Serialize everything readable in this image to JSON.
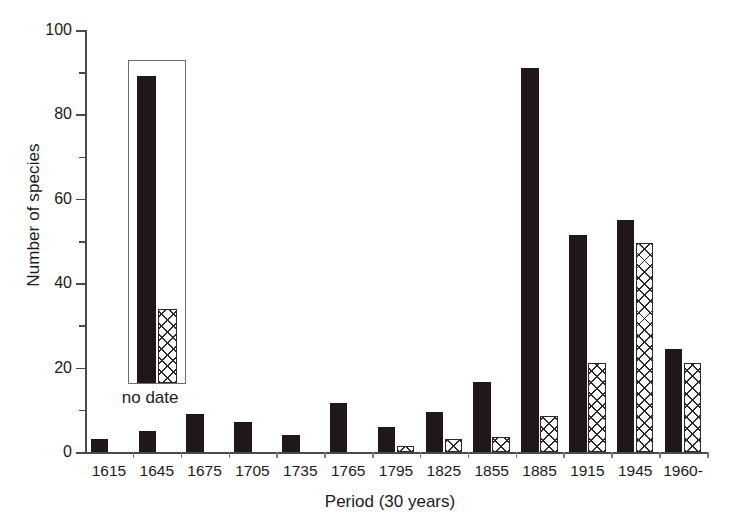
{
  "chart_data": {
    "type": "bar",
    "title": "",
    "xlabel": "Period (30 years)",
    "ylabel": "Number of species",
    "categories": [
      "1615",
      "1645",
      "1675",
      "1705",
      "1735",
      "1765",
      "1795",
      "1825",
      "1855",
      "1885",
      "1915",
      "1945",
      "1960-"
    ],
    "series": [
      {
        "name": "solid-black",
        "style": "solid-black",
        "values": [
          3,
          5,
          9,
          7,
          4,
          11.5,
          6,
          9.5,
          16.5,
          91,
          51.5,
          55,
          24.5
        ]
      },
      {
        "name": "cross-hatched",
        "style": "cross-hatched",
        "values": [
          0,
          0,
          0,
          0,
          0,
          0,
          1.5,
          3,
          3.5,
          8.5,
          21,
          49.5,
          21
        ]
      }
    ],
    "ylim": [
      0,
      100
    ],
    "y_major_ticks": [
      0,
      20,
      40,
      60,
      80,
      100
    ],
    "y_minor_ticks": [
      10,
      30,
      50,
      70,
      90
    ],
    "grid": false,
    "legend": "none",
    "inset": {
      "label": "no date",
      "solid_value": 89,
      "hatch_value": 34,
      "box_top_value": 93,
      "box_bottom_value": 16
    }
  },
  "colors": {
    "solid_bar": "#201818",
    "hatch_line": "#2a2a2a",
    "hatch_fill": "#fdfdfd",
    "axis": "#4a4a4a",
    "text": "#1b1b1b",
    "background": "#ffffff",
    "inset_border": "#6d6d6d"
  }
}
